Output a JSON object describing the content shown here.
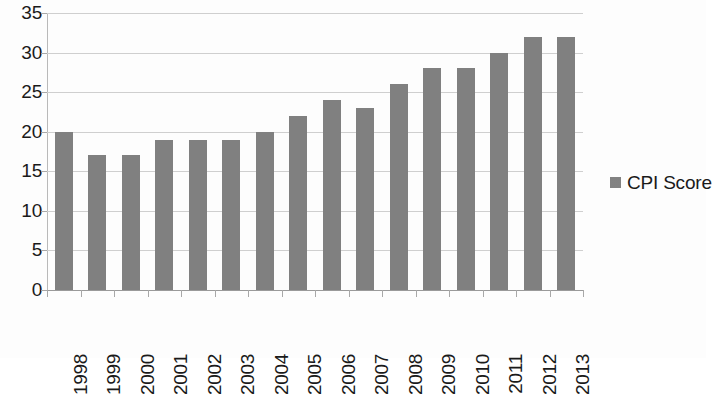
{
  "chart_data": {
    "type": "bar",
    "title": "",
    "xlabel": "",
    "ylabel": "",
    "categories": [
      "1998",
      "1999",
      "2000",
      "2001",
      "2002",
      "2003",
      "2004",
      "2005",
      "2006",
      "2007",
      "2008",
      "2009",
      "2010",
      "2011",
      "2012",
      "2013"
    ],
    "series": [
      {
        "name": "CPI Score",
        "color": "#808080",
        "values": [
          20,
          17,
          17,
          19,
          19,
          19,
          20,
          22,
          24,
          23,
          26,
          28,
          28,
          30,
          32,
          32
        ]
      }
    ],
    "ylim": [
      0,
      35
    ],
    "y_ticks": [
      "0",
      "5",
      "10",
      "15",
      "20",
      "25",
      "30",
      "35"
    ],
    "y_tick_values": [
      0,
      5,
      10,
      15,
      20,
      25,
      30,
      35
    ],
    "grid": true,
    "legend_position": "right",
    "legend": [
      {
        "label": "CPI Score",
        "marker": "square-swatch",
        "color": "#808080"
      }
    ],
    "x_tick_label_rotation": -90,
    "background_color": "#fdfdfd",
    "gridline_color": "#cfcfcf",
    "axis_color": "#9a9a9a",
    "text_color": "#1a1a1a"
  }
}
